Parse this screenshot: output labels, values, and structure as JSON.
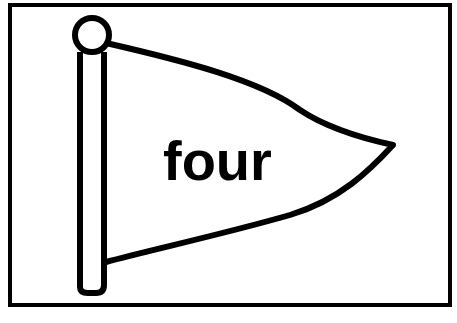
{
  "card": {
    "word": "four",
    "icon": "pennant-flag-icon"
  },
  "colors": {
    "ink": "#000000",
    "background": "#ffffff"
  }
}
